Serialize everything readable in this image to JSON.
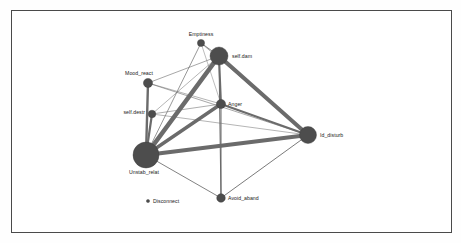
{
  "figure": {
    "type": "network-graph",
    "background_color": "#ffffff",
    "border_color": "#4a4a4a",
    "node_color": "#4d4d4d",
    "edge_color": "#6b6b6b",
    "label_color": "#1a1a1a",
    "width": 461,
    "height": 243
  },
  "chart_data": {
    "type": "network",
    "title": "",
    "xlabel": "",
    "ylabel": "",
    "grid": false,
    "legend": "none",
    "nodes": [
      {
        "id": "Emptiness",
        "label": "Emptiness",
        "x": 201,
        "y": 43,
        "r": 3.6,
        "label_dx": 0,
        "label_dy": -7,
        "label_anchor": "middle"
      },
      {
        "id": "self.dam",
        "label": "self.dam",
        "x": 219,
        "y": 56,
        "r": 9.0,
        "label_dx": 13,
        "label_dy": 1.5,
        "label_anchor": "start"
      },
      {
        "id": "Mood_react",
        "label": "Mood_react",
        "x": 148,
        "y": 83,
        "r": 4.6,
        "label_dx": -9,
        "label_dy": -8,
        "label_anchor": "middle"
      },
      {
        "id": "self.destr",
        "label": "self.destr",
        "x": 152,
        "y": 114,
        "r": 3.8,
        "label_dx": -7,
        "label_dy": 0,
        "label_anchor": "end"
      },
      {
        "id": "Anger",
        "label": "Anger",
        "x": 221,
        "y": 104,
        "r": 4.6,
        "label_dx": 7,
        "label_dy": 1.5,
        "label_anchor": "start"
      },
      {
        "id": "Id_disturb",
        "label": "Id_disturb",
        "x": 308,
        "y": 135,
        "r": 8.5,
        "label_dx": 12,
        "label_dy": 1.5,
        "label_anchor": "start"
      },
      {
        "id": "Unstab_relat",
        "label": "Unstab_relat",
        "x": 146,
        "y": 155,
        "r": 13.0,
        "label_dx": -2,
        "label_dy": 19,
        "label_anchor": "middle"
      },
      {
        "id": "Avoid_aband",
        "label": "Avoid_aband",
        "x": 221,
        "y": 198,
        "r": 4.3,
        "label_dx": 7,
        "label_dy": 1.5,
        "label_anchor": "start"
      },
      {
        "id": "Disconnect",
        "label": "Disconnect",
        "x": 148,
        "y": 201,
        "r": 1.6,
        "label_dx": 5,
        "label_dy": 1.5,
        "label_anchor": "start"
      }
    ],
    "edges": [
      {
        "source": "Unstab_relat",
        "target": "self.dam",
        "weight": 0.95,
        "width": 4.6
      },
      {
        "source": "Unstab_relat",
        "target": "Id_disturb",
        "weight": 0.9,
        "width": 4.2
      },
      {
        "source": "Unstab_relat",
        "target": "Anger",
        "weight": 0.78,
        "width": 3.4
      },
      {
        "source": "self.dam",
        "target": "Id_disturb",
        "weight": 0.88,
        "width": 4.0
      },
      {
        "source": "self.dam",
        "target": "Anger",
        "weight": 0.55,
        "width": 2.0
      },
      {
        "source": "Anger",
        "target": "Id_disturb",
        "weight": 0.52,
        "width": 1.9
      },
      {
        "source": "Unstab_relat",
        "target": "Mood_react",
        "weight": 0.6,
        "width": 2.4
      },
      {
        "source": "Unstab_relat",
        "target": "self.destr",
        "weight": 0.58,
        "width": 2.2
      },
      {
        "source": "self.dam",
        "target": "Avoid_aband",
        "weight": 0.35,
        "width": 1.1
      },
      {
        "source": "Anger",
        "target": "Avoid_aband",
        "weight": 0.3,
        "width": 1.0
      },
      {
        "source": "Unstab_relat",
        "target": "Emptiness",
        "weight": 0.22,
        "width": 0.7
      },
      {
        "source": "Emptiness",
        "target": "self.dam",
        "weight": 0.24,
        "width": 0.8
      },
      {
        "source": "Emptiness",
        "target": "Id_disturb",
        "weight": 0.18,
        "width": 0.55
      },
      {
        "source": "Mood_react",
        "target": "self.dam",
        "weight": 0.2,
        "width": 0.6
      },
      {
        "source": "Mood_react",
        "target": "Id_disturb",
        "weight": 0.2,
        "width": 0.6
      },
      {
        "source": "Mood_react",
        "target": "Anger",
        "weight": 0.16,
        "width": 0.5
      },
      {
        "source": "self.destr",
        "target": "Anger",
        "weight": 0.18,
        "width": 0.55
      },
      {
        "source": "self.destr",
        "target": "Id_disturb",
        "weight": 0.16,
        "width": 0.5
      },
      {
        "source": "self.destr",
        "target": "self.dam",
        "weight": 0.16,
        "width": 0.5
      },
      {
        "source": "Unstab_relat",
        "target": "Avoid_aband",
        "weight": 0.26,
        "width": 0.85
      },
      {
        "source": "Avoid_aband",
        "target": "Id_disturb",
        "weight": 0.28,
        "width": 0.9
      },
      {
        "source": "Emptiness",
        "target": "Anger",
        "weight": 0.14,
        "width": 0.45
      },
      {
        "source": "Unstab_relat",
        "target": "Id_disturb",
        "weight": 0.15,
        "width": 0.5
      }
    ],
    "node_count": 9,
    "edge_count": 23
  }
}
